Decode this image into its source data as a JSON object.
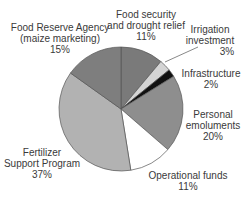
{
  "chart_data": {
    "type": "pie",
    "title": "",
    "start_angle_deg": 0,
    "direction": "clockwise",
    "slices": [
      {
        "label": "Food security and drought relief",
        "value": 11,
        "color": "#7a7a7a"
      },
      {
        "label": "Irrigation investment",
        "value": 3,
        "color": "#d4d4d4"
      },
      {
        "label": "Infrastructure",
        "value": 2,
        "color": "#111111"
      },
      {
        "label": "Personal emoluments",
        "value": 20,
        "color": "#8e8e8e"
      },
      {
        "label": "Operational funds",
        "value": 11,
        "color": "#ffffff"
      },
      {
        "label": "Fertilizer Support Program",
        "value": 37,
        "color": "#b2b2b2"
      },
      {
        "label": "Food Reserve Agency (maize marketing)",
        "value": 15,
        "color": "#7e7e7e"
      }
    ]
  },
  "labels": {
    "food_security": {
      "line1": "Food security",
      "line2": "and drought relief",
      "pct": "11%"
    },
    "irrigation": {
      "line1": "Irrigation",
      "line2": "investment",
      "pct": "3%"
    },
    "infrastructure": {
      "line1": "Infrastructure",
      "pct": "2%"
    },
    "personal": {
      "line1": "Personal",
      "line2": "emoluments",
      "pct": "20%"
    },
    "operational": {
      "line1": "Operational funds",
      "pct": "11%"
    },
    "fertilizer": {
      "line1": "Fertilizer",
      "line2": "Support Program",
      "pct": "37%"
    },
    "fra": {
      "line1": "Food Reserve Agency",
      "line2": "(maize marketing)",
      "pct": "15%"
    }
  }
}
